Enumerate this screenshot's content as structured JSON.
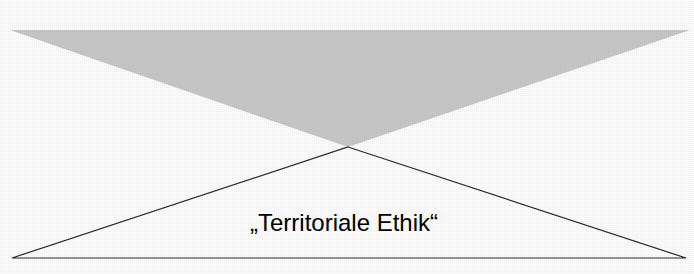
{
  "figure": {
    "background_color": "#ffffff",
    "width": 694,
    "height": 274,
    "label": {
      "text": "„Territoriale Ethik“",
      "color": "#000000",
      "font_size_px": 24,
      "center_x": 344,
      "baseline_y": 231
    },
    "upper_triangle": {
      "name": "gray-filled-downward-triangle",
      "fill_color": "#c9c9c9",
      "points": "10,30 690,30 348,147",
      "vertices": [
        {
          "x": 10,
          "y": 30
        },
        {
          "x": 690,
          "y": 30
        },
        {
          "x": 348,
          "y": 147
        }
      ]
    },
    "lower_triangle": {
      "name": "outlined-upward-triangle",
      "stroke_color": "#2a2a2a",
      "fill_color": "none",
      "stroke_width": 1.2,
      "points": "348,147 686,258 12,258",
      "vertices": [
        {
          "x": 348,
          "y": 147
        },
        {
          "x": 686,
          "y": 258
        },
        {
          "x": 12,
          "y": 258
        }
      ]
    }
  }
}
